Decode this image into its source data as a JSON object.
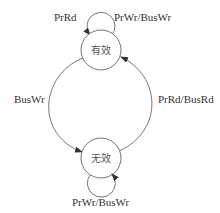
{
  "diagram": {
    "type": "state-transition",
    "states": [
      {
        "id": "valid",
        "label": "有效"
      },
      {
        "id": "invalid",
        "label": "无效"
      }
    ],
    "transitions": [
      {
        "from": "valid",
        "to": "valid",
        "label": "PrRd"
      },
      {
        "from": "valid",
        "to": "valid",
        "label": "PrWr/BusWr"
      },
      {
        "from": "valid",
        "to": "invalid",
        "label": "BusWr"
      },
      {
        "from": "invalid",
        "to": "valid",
        "label": "PrRd/BusRd"
      },
      {
        "from": "invalid",
        "to": "invalid",
        "label": "PrWr/BusWr"
      }
    ],
    "labels": {
      "top_loop_left": "PrRd",
      "top_loop_right": "PrWr/BusWr",
      "left_arc": "BusWr",
      "right_arc": "PrRd/BusRd",
      "bottom_loop": "PrWr/BusWr"
    },
    "colors": {
      "stroke": "#555555",
      "text": "#333333"
    }
  }
}
